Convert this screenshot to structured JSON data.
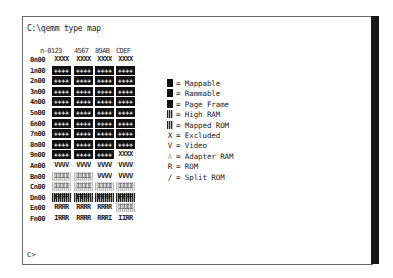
{
  "command": "C:\\qemm type map",
  "prompt": "C>",
  "map": {
    "header": [
      "n-0123",
      "4567",
      "89AB",
      "CDEF"
    ],
    "rows": [
      {
        "label": "0n00",
        "cells": [
          {
            "t": "XXXX",
            "k": "txt"
          },
          {
            "t": "XXXX",
            "k": "txt"
          },
          {
            "t": "XXXX",
            "k": "txt"
          },
          {
            "t": "XXXX",
            "k": "txt"
          }
        ]
      },
      {
        "label": "1n00",
        "cells": [
          {
            "t": "++++",
            "k": "dark"
          },
          {
            "t": "++++",
            "k": "dark"
          },
          {
            "t": "++++",
            "k": "dark"
          },
          {
            "t": "++++",
            "k": "dark"
          }
        ]
      },
      {
        "label": "2n00",
        "cells": [
          {
            "t": "++++",
            "k": "dark"
          },
          {
            "t": "++++",
            "k": "dark"
          },
          {
            "t": "++++",
            "k": "dark"
          },
          {
            "t": "++++",
            "k": "dark"
          }
        ]
      },
      {
        "label": "3n00",
        "cells": [
          {
            "t": "++++",
            "k": "dark"
          },
          {
            "t": "++++",
            "k": "dark"
          },
          {
            "t": "++++",
            "k": "dark"
          },
          {
            "t": "++++",
            "k": "dark"
          }
        ]
      },
      {
        "label": "4n00",
        "cells": [
          {
            "t": "++++",
            "k": "dark"
          },
          {
            "t": "++++",
            "k": "dark"
          },
          {
            "t": "++++",
            "k": "dark"
          },
          {
            "t": "++++",
            "k": "dark"
          }
        ]
      },
      {
        "label": "5n00",
        "cells": [
          {
            "t": "++++",
            "k": "dark"
          },
          {
            "t": "++++",
            "k": "dark"
          },
          {
            "t": "++++",
            "k": "dark"
          },
          {
            "t": "++++",
            "k": "dark"
          }
        ]
      },
      {
        "label": "6n00",
        "cells": [
          {
            "t": "++++",
            "k": "dark"
          },
          {
            "t": "++++",
            "k": "dark"
          },
          {
            "t": "++++",
            "k": "dark"
          },
          {
            "t": "++++",
            "k": "dark"
          }
        ]
      },
      {
        "label": "7n00",
        "cells": [
          {
            "t": "++++",
            "k": "dark"
          },
          {
            "t": "++++",
            "k": "dark"
          },
          {
            "t": "++++",
            "k": "dark"
          },
          {
            "t": "++++",
            "k": "dark"
          }
        ]
      },
      {
        "label": "8n00",
        "cells": [
          {
            "t": "++++",
            "k": "dark"
          },
          {
            "t": "++++",
            "k": "dark"
          },
          {
            "t": "++++",
            "k": "dark"
          },
          {
            "t": "++++",
            "k": "dark"
          }
        ]
      },
      {
        "label": "9n00",
        "cells": [
          {
            "t": "++++",
            "k": "dark"
          },
          {
            "t": "++++",
            "k": "dark"
          },
          {
            "t": "++++",
            "k": "dark"
          },
          {
            "t": "XXXX",
            "k": "txt"
          }
        ]
      },
      {
        "label": "An00",
        "cells": [
          {
            "t": "VVVV",
            "k": "txt"
          },
          {
            "t": "VVVV",
            "k": "txt"
          },
          {
            "t": "VVVV",
            "k": "txt"
          },
          {
            "t": "VVVV",
            "k": "txt"
          }
        ]
      },
      {
        "label": "Bn00",
        "cells": [
          {
            "t": "IIII",
            "k": "grey"
          },
          {
            "t": "IIII",
            "k": "grey"
          },
          {
            "t": "VVVV",
            "k": "txt"
          },
          {
            "t": "VVVV",
            "k": "txt"
          }
        ]
      },
      {
        "label": "Cn00",
        "cells": [
          {
            "t": "IIII",
            "k": "grey"
          },
          {
            "t": "IIII",
            "k": "grey"
          },
          {
            "t": "IIII",
            "k": "grey"
          },
          {
            "t": "IIII",
            "k": "grey"
          }
        ]
      },
      {
        "label": "Dn00",
        "cells": [
          {
            "t": "FFFF",
            "k": "stripe"
          },
          {
            "t": "FFFF",
            "k": "stripe"
          },
          {
            "t": "FFFF",
            "k": "stripe"
          },
          {
            "t": "FFFF",
            "k": "stripe"
          }
        ]
      },
      {
        "label": "En00",
        "cells": [
          {
            "t": "RRRR",
            "k": "txt"
          },
          {
            "t": "RRRR",
            "k": "txt"
          },
          {
            "t": "RRRR",
            "k": "txt"
          },
          {
            "t": "IIII",
            "k": "grey"
          }
        ]
      },
      {
        "label": "Fn00",
        "cells": [
          {
            "t": "IRRR",
            "k": "txt"
          },
          {
            "t": "RRRR",
            "k": "txt"
          },
          {
            "t": "RRRI",
            "k": "txt"
          },
          {
            "t": "IIRR",
            "k": "txt"
          }
        ]
      }
    ]
  },
  "legend": [
    {
      "symbol": "block",
      "label": "= Mappable"
    },
    {
      "symbol": "block",
      "label": "= Rammable"
    },
    {
      "symbol": "block",
      "label": "= Page Frame"
    },
    {
      "symbol": "bar",
      "label": "= High RAM"
    },
    {
      "symbol": "bar",
      "label": "= Mapped ROM"
    },
    {
      "symbol": "X",
      "label": "= Excluded"
    },
    {
      "symbol": "V",
      "label": "= Video"
    },
    {
      "symbol": "A",
      "label": "= Adapter RAM"
    },
    {
      "symbol": "R",
      "label": "= ROM"
    },
    {
      "symbol": "/",
      "label": "= Split ROM"
    }
  ]
}
